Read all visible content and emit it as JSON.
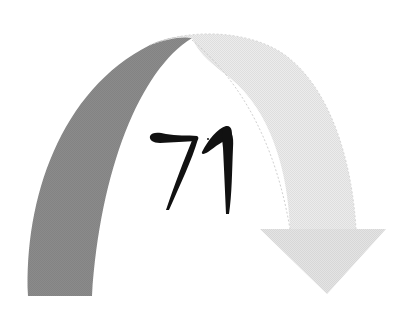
{
  "figure": {
    "label": "71",
    "colors": {
      "background": "#ffffff",
      "arc_dark": "#8a8a8a",
      "arc_light": "#e2e2e2",
      "arrow_head": "#e6e6e6",
      "label_ink": "#111111"
    }
  }
}
